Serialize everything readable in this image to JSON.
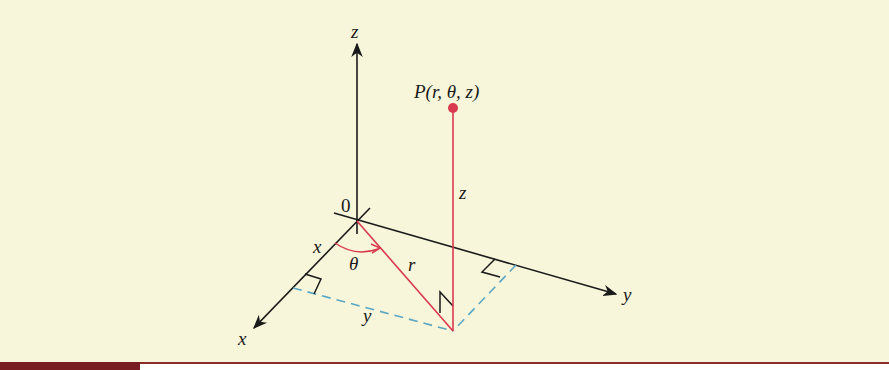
{
  "figure": {
    "colors": {
      "background": "#f8f6da",
      "axes": "#1a1a1a",
      "radial": "#d9394e",
      "dashed": "#5aa6c4",
      "bottom_rule": "#8e2a2a"
    },
    "labels": {
      "z_axis": "z",
      "y_axis": "y",
      "x_axis": "x",
      "origin": "0",
      "point": "P(r, θ, z)",
      "segment_z": "z",
      "segment_r": "r",
      "segment_x": "x",
      "segment_y": "y",
      "angle": "θ"
    }
  }
}
